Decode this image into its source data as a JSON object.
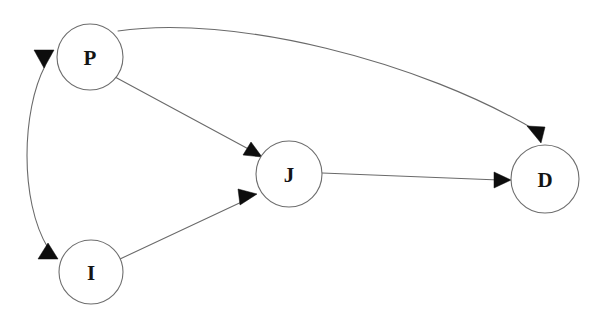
{
  "diagram": {
    "type": "directed-graph",
    "background_color": "#ffffff",
    "node_stroke_color": "#6e6e6e",
    "edge_stroke_color": "#6a6a6a",
    "arrow_color": "#0d0d0d",
    "label_color": "#141414",
    "nodes": [
      {
        "id": "P",
        "label": "P",
        "cx": 90,
        "cy": 57,
        "r": 33
      },
      {
        "id": "J",
        "label": "J",
        "cx": 289,
        "cy": 174,
        "r": 33
      },
      {
        "id": "D",
        "label": "D",
        "cx": 545,
        "cy": 179,
        "r": 34
      },
      {
        "id": "I",
        "label": "I",
        "cx": 91,
        "cy": 272,
        "r": 32
      }
    ],
    "edges": [
      {
        "id": "P-to-D",
        "from": "P",
        "to": "D",
        "shape": "curve",
        "direction": "one-way"
      },
      {
        "id": "P-to-J",
        "from": "P",
        "to": "J",
        "shape": "line",
        "direction": "one-way"
      },
      {
        "id": "I-to-J",
        "from": "I",
        "to": "J",
        "shape": "line",
        "direction": "one-way"
      },
      {
        "id": "J-to-D",
        "from": "J",
        "to": "D",
        "shape": "line",
        "direction": "one-way"
      },
      {
        "id": "P-and-I",
        "from": "I",
        "to": "P",
        "shape": "curve",
        "direction": "bidirectional"
      }
    ]
  }
}
